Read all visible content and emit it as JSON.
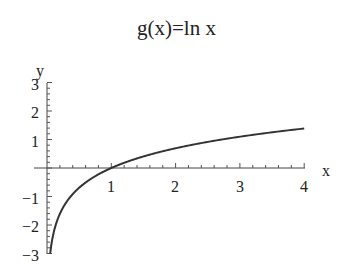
{
  "chart_data": {
    "type": "line",
    "title": "g(x)=ln x",
    "xlabel": "x",
    "ylabel": "y",
    "xlim": [
      0,
      4
    ],
    "ylim": [
      -3,
      3
    ],
    "x_ticks": [
      "1",
      "2",
      "3",
      "4"
    ],
    "y_ticks": [
      "3",
      "2",
      "1",
      "-1",
      "-2",
      "-3"
    ],
    "grid": false,
    "legend": null,
    "series": [
      {
        "name": "ln x",
        "x": [
          0.05,
          0.1,
          0.2,
          0.3,
          0.5,
          0.75,
          1,
          1.5,
          2,
          2.5,
          3,
          3.5,
          4
        ],
        "y": [
          -3.0,
          -2.3,
          -1.61,
          -1.2,
          -0.69,
          -0.29,
          0,
          0.41,
          0.69,
          0.92,
          1.1,
          1.25,
          1.39
        ]
      }
    ]
  },
  "labels": {
    "title": "g(x)=ln x",
    "x_axis": "x",
    "y_axis": "y",
    "x_tick_1": "1",
    "x_tick_2": "2",
    "x_tick_3": "3",
    "x_tick_4": "4",
    "y_tick_3": "3",
    "y_tick_2": "2",
    "y_tick_1": "1",
    "y_tick_m1": "−1",
    "y_tick_m2": "−2",
    "y_tick_m3": "−3"
  }
}
